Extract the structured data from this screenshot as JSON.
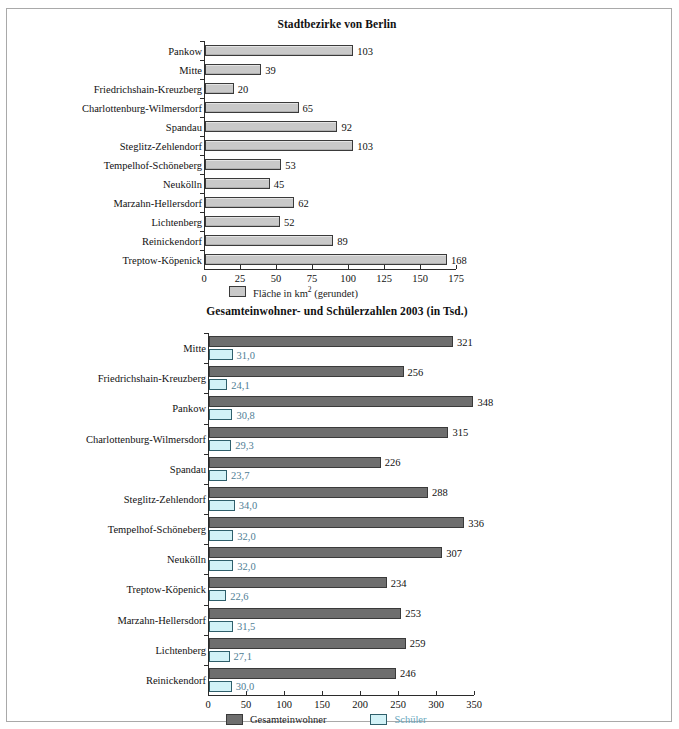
{
  "figure": {
    "border_color": "#a9a9a9",
    "background": "#ffffff"
  },
  "chart_data": [
    {
      "id": "area",
      "type": "bar",
      "orientation": "horizontal",
      "title": "Stadtbezirke von Berlin",
      "xlabel": "",
      "ylabel": "",
      "xlim": [
        0,
        175
      ],
      "xticks": [
        0,
        25,
        50,
        75,
        100,
        125,
        150,
        175
      ],
      "xticklabels": [
        "0",
        "25",
        "50",
        "75",
        "100",
        "125",
        "150",
        "175"
      ],
      "grid": false,
      "legend_position": "bottom-left",
      "legend": [
        {
          "label": "Fläche in km² (gerundet)",
          "color": "#c9c9c9",
          "border": "#3a3a3a",
          "text_color": "#111111"
        }
      ],
      "series": [
        {
          "name": "Fläche in km² (gerundet)",
          "color": "#c9c9c9",
          "border": "#3a3a3a",
          "values": [
            103,
            39,
            20,
            65,
            92,
            103,
            53,
            45,
            62,
            52,
            89,
            168
          ],
          "value_labels": [
            "103",
            "39",
            "20",
            "65",
            "92",
            "103",
            "53",
            "45",
            "62",
            "52",
            "89",
            "168"
          ]
        }
      ],
      "categories": [
        "Pankow",
        "Mitte",
        "Friedrichshain-Kreuzberg",
        "Charlottenburg-Wilmersdorf",
        "Spandau",
        "Steglitz-Zehlendorf",
        "Tempelhof-Schöneberg",
        "Neukölln",
        "Marzahn-Hellersdorf",
        "Lichtenberg",
        "Reinickendorf",
        "Treptow-Köpenick"
      ]
    },
    {
      "id": "population",
      "type": "bar",
      "orientation": "horizontal",
      "title": "Gesamteinwohner- und Schülerzahlen 2003 (in Tsd.)",
      "xlabel": "",
      "ylabel": "",
      "xlim": [
        0,
        350
      ],
      "xticks": [
        0,
        50,
        100,
        150,
        200,
        250,
        300,
        350
      ],
      "xticklabels": [
        "0",
        "50",
        "100",
        "150",
        "200",
        "250",
        "300",
        "350"
      ],
      "grid": false,
      "legend_position": "bottom-center",
      "legend": [
        {
          "label": "Gesamteinwohner",
          "color": "#6e6e6e",
          "border": "#3a3a3a",
          "text_color": "#111111"
        },
        {
          "label": "Schüler",
          "color": "#d2f2f7",
          "border": "#2f5f6b",
          "text_color": "#67a6bd"
        }
      ],
      "categories": [
        "Mitte",
        "Friedrichshain-Kreuzberg",
        "Pankow",
        "Charlottenburg-Wilmersdorf",
        "Spandau",
        "Steglitz-Zehlendorf",
        "Tempelhof-Schöneberg",
        "Neukölln",
        "Treptow-Köpenick",
        "Marzahn-Hellersdorf",
        "Lichtenberg",
        "Reinickendorf"
      ],
      "series": [
        {
          "name": "Gesamteinwohner",
          "color": "#6e6e6e",
          "border": "#3a3a3a",
          "text_color": "#111111",
          "values": [
            321,
            256,
            348,
            315,
            226,
            288,
            336,
            307,
            234,
            253,
            259,
            246
          ],
          "value_labels": [
            "321",
            "256",
            "348",
            "315",
            "226",
            "288",
            "336",
            "307",
            "234",
            "253",
            "259",
            "246"
          ]
        },
        {
          "name": "Schüler",
          "color": "#d2f2f7",
          "border": "#2f5f6b",
          "text_color": "#4f7e95",
          "values": [
            31.0,
            24.1,
            30.8,
            29.3,
            23.7,
            34.0,
            32.0,
            32.0,
            22.6,
            31.5,
            27.1,
            30.0
          ],
          "value_labels": [
            "31,0",
            "24,1",
            "30,8",
            "29,3",
            "23,7",
            "34,0",
            "32,0",
            "32,0",
            "22,6",
            "31,5",
            "27,1",
            "30,0"
          ]
        }
      ]
    }
  ]
}
